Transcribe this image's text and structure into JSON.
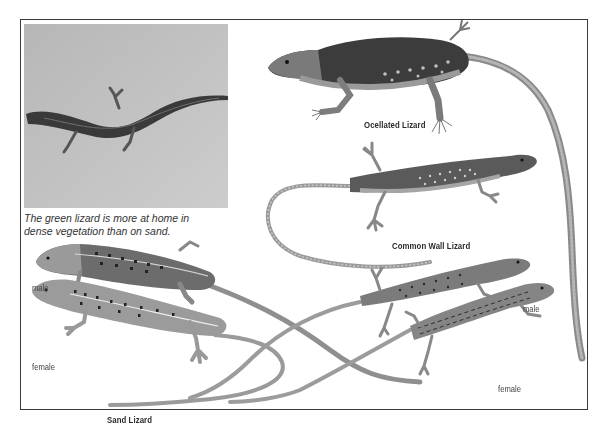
{
  "page": {
    "photo": {
      "subject": "green lizard on sand photograph"
    },
    "caption": {
      "line1": "The green lizard is more at home in",
      "line2": "dense vegetation than on sand."
    },
    "species": [
      {
        "name": "Ocellated Lizard"
      },
      {
        "name": "Common Wall Lizard"
      },
      {
        "name": "Sand Lizard",
        "variants": [
          "male",
          "female"
        ]
      },
      {
        "name": "Viviparous Lizard",
        "variants": [
          "male",
          "female"
        ]
      }
    ],
    "labels": {
      "ocellated": "Ocellated Lizard",
      "common_wall": "Common Wall Lizard",
      "sand": "Sand Lizard",
      "sand_male": "male",
      "sand_female": "female",
      "viviparous": "Viviparous Lizard",
      "viviparous_male": "male",
      "viviparous_female": "female"
    },
    "colors": {
      "frame": "#3a3a3a",
      "text": "#2a2a2a",
      "photo_bg": "#bdbdbd"
    }
  }
}
